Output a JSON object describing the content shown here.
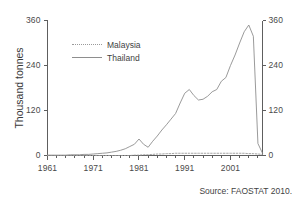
{
  "chart_data": {
    "type": "line",
    "title": "",
    "xlabel": "",
    "ylabel": "Thousand tonnes",
    "xlim": [
      1961,
      2008
    ],
    "ylim": [
      0,
      360
    ],
    "yticks": [
      0,
      120,
      240,
      360
    ],
    "xticks": [
      1961,
      1971,
      1981,
      1991,
      2001
    ],
    "xtick_labels": [
      "1961",
      "1971",
      "1981",
      "1991",
      "2001"
    ],
    "ytick_labels_left": [
      "0",
      "120",
      "240",
      "360"
    ],
    "ytick_labels_right": [
      "0",
      "120",
      "240",
      "360"
    ],
    "minor_xtick_interval": 2,
    "grid": false,
    "legend_position": "upper-left-inside",
    "dual_y_axis": true,
    "annotations": [
      "Source: FAOSTAT 2010."
    ],
    "x": [
      1961,
      1962,
      1963,
      1964,
      1965,
      1966,
      1967,
      1968,
      1969,
      1970,
      1971,
      1972,
      1973,
      1974,
      1975,
      1976,
      1977,
      1978,
      1979,
      1980,
      1981,
      1982,
      1983,
      1984,
      1985,
      1986,
      1987,
      1988,
      1989,
      1990,
      1991,
      1992,
      1993,
      1994,
      1995,
      1996,
      1997,
      1998,
      1999,
      2000,
      2001,
      2002,
      2003,
      2004,
      2005,
      2006,
      2007,
      2008
    ],
    "series": [
      {
        "name": "Malaysia",
        "style": "dashed",
        "color": "#9a9a9a",
        "values": [
          0,
          0,
          0,
          0,
          0,
          0,
          0,
          0,
          0,
          0,
          0,
          0,
          0,
          0,
          0,
          0,
          0,
          0,
          0,
          1,
          1,
          2,
          2,
          3,
          4,
          4,
          5,
          5,
          6,
          6,
          6,
          6,
          6,
          6,
          6,
          6,
          6,
          6,
          6,
          6,
          6,
          6,
          6,
          6,
          5,
          5,
          4,
          3
        ]
      },
      {
        "name": "Thailand",
        "style": "solid",
        "color": "#8e8e8e",
        "values": [
          1,
          1,
          1,
          1,
          1,
          2,
          2,
          2,
          3,
          3,
          4,
          5,
          6,
          7,
          9,
          11,
          14,
          18,
          24,
          30,
          44,
          30,
          22,
          38,
          52,
          68,
          82,
          97,
          112,
          140,
          166,
          176,
          160,
          148,
          150,
          158,
          170,
          176,
          198,
          208,
          240,
          268,
          300,
          330,
          348,
          318,
          32,
          6
        ]
      }
    ]
  },
  "legend": {
    "items": [
      {
        "label": "Malaysia"
      },
      {
        "label": "Thailand"
      }
    ]
  },
  "axes": {
    "ylabel": "Thousand tonnes"
  },
  "source_note": "Source: FAOSTAT 2010."
}
